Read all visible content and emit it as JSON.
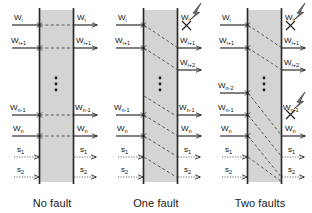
{
  "figure": {
    "title": "",
    "panel_count": 3
  },
  "panels": [
    {
      "id": "no-fault",
      "caption": "No fault",
      "fault_count": 0,
      "inputs": [
        "Wᵢ",
        "Wᵢ₊₁",
        "Wₙ₋₁",
        "Wₙ",
        "s₁",
        "s₂"
      ],
      "outputs": [
        "Wᵢ",
        "Wᵢ₊₁",
        "Wₙ₋₁",
        "Wₙ",
        "s₁",
        "s₂"
      ],
      "left_labels": [
        {
          "base": "W",
          "sub": "i",
          "y": 20,
          "style": "solid"
        },
        {
          "base": "W",
          "sub": "i+1",
          "y": 43,
          "style": "solid"
        },
        {
          "base": "W",
          "sub": "n-1",
          "y": 110,
          "style": "solid"
        },
        {
          "base": "W",
          "sub": "n",
          "y": 131,
          "style": "solid"
        },
        {
          "base": "s",
          "sub": "1",
          "y": 152,
          "style": "dotted"
        },
        {
          "base": "s",
          "sub": "2",
          "y": 172,
          "style": "dotted"
        }
      ],
      "right_labels": [
        {
          "base": "W",
          "sub": "i",
          "y": 20,
          "style": "solid",
          "crossed": false,
          "bolt": false
        },
        {
          "base": "W",
          "sub": "i+1",
          "y": 43,
          "style": "solid",
          "crossed": false,
          "bolt": false
        },
        {
          "base": "W",
          "sub": "n-1",
          "y": 110,
          "style": "solid",
          "crossed": false,
          "bolt": false
        },
        {
          "base": "W",
          "sub": "n",
          "y": 131,
          "style": "solid",
          "crossed": false,
          "bolt": false
        },
        {
          "base": "s",
          "sub": "1",
          "y": 152,
          "style": "dotted",
          "crossed": false,
          "bolt": false
        },
        {
          "base": "s",
          "sub": "2",
          "y": 172,
          "style": "dotted",
          "crossed": false,
          "bolt": false
        }
      ],
      "internal_paths": "horizontal",
      "vertical_ellipsis_y": 84
    },
    {
      "id": "one-fault",
      "caption": "One fault",
      "fault_count": 1,
      "left_labels": [
        {
          "base": "W",
          "sub": "i",
          "y": 20,
          "style": "solid"
        },
        {
          "base": "W",
          "sub": "i+1",
          "y": 43,
          "style": "solid"
        },
        {
          "base": "W",
          "sub": "n-1",
          "y": 110,
          "style": "solid"
        },
        {
          "base": "W",
          "sub": "n",
          "y": 131,
          "style": "solid"
        },
        {
          "base": "s",
          "sub": "1",
          "y": 152,
          "style": "dotted"
        },
        {
          "base": "s",
          "sub": "2",
          "y": 172,
          "style": "dotted"
        }
      ],
      "right_labels": [
        {
          "base": "W",
          "sub": "i",
          "y": 20,
          "style": "none",
          "crossed": true,
          "bolt": true
        },
        {
          "base": "W",
          "sub": "i+1",
          "y": 43,
          "style": "solid",
          "crossed": false,
          "bolt": false
        },
        {
          "base": "W",
          "sub": "i+2",
          "y": 64,
          "style": "solid",
          "crossed": false,
          "bolt": false
        },
        {
          "base": "W",
          "sub": "n-1",
          "y": 110,
          "style": "solid",
          "crossed": false,
          "bolt": false
        },
        {
          "base": "W",
          "sub": "n",
          "y": 131,
          "style": "solid",
          "crossed": false,
          "bolt": false
        },
        {
          "base": "s",
          "sub": "1",
          "y": 152,
          "style": "dotted",
          "crossed": false,
          "bolt": false
        },
        {
          "base": "s",
          "sub": "2",
          "y": 172,
          "style": "dotted",
          "crossed": false,
          "bolt": false
        }
      ],
      "internal_paths": "diagonal-shift-1",
      "vertical_ellipsis_y": 84
    },
    {
      "id": "two-faults",
      "caption": "Two faults",
      "fault_count": 2,
      "left_labels": [
        {
          "base": "W",
          "sub": "i",
          "y": 20,
          "style": "solid"
        },
        {
          "base": "W",
          "sub": "i+1",
          "y": 43,
          "style": "solid"
        },
        {
          "base": "W",
          "sub": "n-2",
          "y": 88,
          "style": "solid"
        },
        {
          "base": "W",
          "sub": "n-1",
          "y": 110,
          "style": "solid"
        },
        {
          "base": "W",
          "sub": "n",
          "y": 131,
          "style": "solid"
        },
        {
          "base": "s",
          "sub": "1",
          "y": 152,
          "style": "dotted"
        },
        {
          "base": "s",
          "sub": "2",
          "y": 172,
          "style": "dotted"
        }
      ],
      "right_labels": [
        {
          "base": "W",
          "sub": "i",
          "y": 20,
          "style": "none",
          "crossed": true,
          "bolt": true
        },
        {
          "base": "W",
          "sub": "i+1",
          "y": 43,
          "style": "solid",
          "crossed": false,
          "bolt": false
        },
        {
          "base": "W",
          "sub": "i+2",
          "y": 64,
          "style": "solid",
          "crossed": false,
          "bolt": false
        },
        {
          "base": "W",
          "sub": "n-1",
          "y": 110,
          "style": "none",
          "crossed": true,
          "bolt": true
        },
        {
          "base": "W",
          "sub": "n",
          "y": 131,
          "style": "solid",
          "crossed": false,
          "bolt": false
        },
        {
          "base": "s",
          "sub": "1",
          "y": 152,
          "style": "dotted",
          "crossed": false,
          "bolt": false
        },
        {
          "base": "s",
          "sub": "2",
          "y": 172,
          "style": "dotted",
          "crossed": false,
          "bolt": false
        }
      ],
      "internal_paths": "diagonal-shift-2",
      "vertical_ellipsis_y": 84
    }
  ],
  "colors": {
    "ink": "#1a1a1a",
    "box_fill": "#d4d4d4",
    "box_border": "#2b2b2b",
    "dash": "#4a4a4a",
    "background": "#ffffff"
  },
  "geometry": {
    "panel_width": 104,
    "panel_height": 213,
    "box_left": 39,
    "box_right": 74,
    "arrow_in_start": 12,
    "arrow_out_end": 100
  }
}
